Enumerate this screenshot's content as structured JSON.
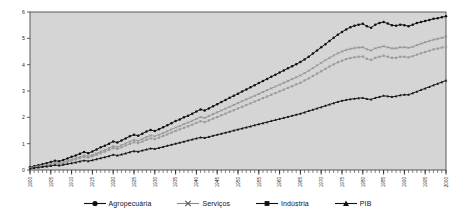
{
  "chart_data": {
    "type": "line",
    "title": "",
    "subtitle": "",
    "xlabel": "",
    "ylabel": "",
    "xlim": [
      1900,
      2000
    ],
    "ylim": [
      0,
      6
    ],
    "yticks": [
      0,
      1,
      2,
      3,
      4,
      5,
      6
    ],
    "ytick_labels": [
      "0",
      "1",
      "2",
      "3",
      "4",
      "5",
      "6"
    ],
    "xticks": [
      1900,
      1905,
      1910,
      1915,
      1920,
      1925,
      1930,
      1935,
      1940,
      1945,
      1950,
      1955,
      1960,
      1965,
      1970,
      1975,
      1980,
      1985,
      1990,
      1995,
      2000
    ],
    "xtick_labels": [
      "1900",
      "1905",
      "1910",
      "1915",
      "1920",
      "1925",
      "1930",
      "1935",
      "1940",
      "1945",
      "1950",
      "1955",
      "1960",
      "1965",
      "1970",
      "1975",
      "1980",
      "1985",
      "1990",
      "1995",
      "2000"
    ],
    "xtick_rotation": 90,
    "minor_xticks_interval": 1,
    "grid": false,
    "plot_background": "#d5d5d5",
    "legend_position": "bottom",
    "x": [
      1900,
      1901,
      1902,
      1903,
      1904,
      1905,
      1906,
      1907,
      1908,
      1909,
      1910,
      1911,
      1912,
      1913,
      1914,
      1915,
      1916,
      1917,
      1918,
      1919,
      1920,
      1921,
      1922,
      1923,
      1924,
      1925,
      1926,
      1927,
      1928,
      1929,
      1930,
      1931,
      1932,
      1933,
      1934,
      1935,
      1936,
      1937,
      1938,
      1939,
      1940,
      1941,
      1942,
      1943,
      1944,
      1945,
      1946,
      1947,
      1948,
      1949,
      1950,
      1951,
      1952,
      1953,
      1954,
      1955,
      1956,
      1957,
      1958,
      1959,
      1960,
      1961,
      1962,
      1963,
      1964,
      1965,
      1966,
      1967,
      1968,
      1969,
      1970,
      1971,
      1972,
      1973,
      1974,
      1975,
      1976,
      1977,
      1978,
      1979,
      1980,
      1981,
      1982,
      1983,
      1984,
      1985,
      1986,
      1987,
      1988,
      1989,
      1990,
      1991,
      1992,
      1993,
      1994,
      1995,
      1996,
      1997,
      1998,
      1999,
      2000
    ],
    "series": [
      {
        "name": "Agropecuária",
        "color": "#101010",
        "marker": "circle",
        "values": [
          0.1,
          0.14,
          0.18,
          0.22,
          0.26,
          0.3,
          0.35,
          0.33,
          0.38,
          0.44,
          0.5,
          0.55,
          0.62,
          0.68,
          0.64,
          0.7,
          0.78,
          0.86,
          0.92,
          1.0,
          1.08,
          1.04,
          1.12,
          1.2,
          1.28,
          1.34,
          1.3,
          1.38,
          1.46,
          1.52,
          1.48,
          1.55,
          1.62,
          1.7,
          1.78,
          1.86,
          1.92,
          2.0,
          2.06,
          2.14,
          2.22,
          2.3,
          2.26,
          2.34,
          2.42,
          2.5,
          2.58,
          2.66,
          2.74,
          2.82,
          2.9,
          2.98,
          3.06,
          3.14,
          3.22,
          3.3,
          3.38,
          3.46,
          3.54,
          3.62,
          3.7,
          3.78,
          3.86,
          3.94,
          4.02,
          4.1,
          4.2,
          4.3,
          4.42,
          4.54,
          4.66,
          4.78,
          4.9,
          5.02,
          5.14,
          5.24,
          5.34,
          5.42,
          5.48,
          5.52,
          5.55,
          5.46,
          5.4,
          5.52,
          5.58,
          5.62,
          5.56,
          5.5,
          5.48,
          5.52,
          5.5,
          5.46,
          5.52,
          5.58,
          5.62,
          5.66,
          5.7,
          5.74,
          5.76,
          5.8,
          5.84
        ]
      },
      {
        "name": "Serviços",
        "color": "#8a8a8a",
        "marker": "x",
        "values": [
          0.08,
          0.11,
          0.14,
          0.17,
          0.2,
          0.24,
          0.28,
          0.26,
          0.3,
          0.35,
          0.4,
          0.44,
          0.5,
          0.55,
          0.52,
          0.57,
          0.63,
          0.7,
          0.76,
          0.83,
          0.9,
          0.87,
          0.94,
          1.01,
          1.08,
          1.14,
          1.11,
          1.18,
          1.25,
          1.31,
          1.28,
          1.34,
          1.4,
          1.47,
          1.54,
          1.61,
          1.67,
          1.74,
          1.8,
          1.87,
          1.94,
          2.01,
          1.98,
          2.05,
          2.12,
          2.19,
          2.26,
          2.33,
          2.4,
          2.47,
          2.54,
          2.61,
          2.68,
          2.75,
          2.82,
          2.89,
          2.96,
          3.03,
          3.1,
          3.17,
          3.24,
          3.31,
          3.38,
          3.45,
          3.52,
          3.59,
          3.68,
          3.77,
          3.87,
          3.97,
          4.07,
          4.17,
          4.26,
          4.35,
          4.43,
          4.5,
          4.56,
          4.6,
          4.63,
          4.65,
          4.66,
          4.58,
          4.54,
          4.62,
          4.66,
          4.7,
          4.66,
          4.62,
          4.62,
          4.66,
          4.66,
          4.64,
          4.68,
          4.74,
          4.8,
          4.85,
          4.9,
          4.95,
          4.98,
          5.02,
          5.06
        ]
      },
      {
        "name": "Indústria",
        "color": "#9a9a9a",
        "marker": "square",
        "values": [
          0.07,
          0.09,
          0.12,
          0.15,
          0.18,
          0.21,
          0.25,
          0.23,
          0.27,
          0.31,
          0.36,
          0.4,
          0.45,
          0.5,
          0.47,
          0.52,
          0.58,
          0.64,
          0.7,
          0.76,
          0.83,
          0.8,
          0.86,
          0.93,
          0.99,
          1.05,
          1.02,
          1.08,
          1.15,
          1.2,
          1.17,
          1.23,
          1.29,
          1.35,
          1.42,
          1.48,
          1.54,
          1.6,
          1.66,
          1.72,
          1.79,
          1.85,
          1.82,
          1.88,
          1.95,
          2.01,
          2.08,
          2.14,
          2.21,
          2.27,
          2.34,
          2.4,
          2.47,
          2.53,
          2.6,
          2.66,
          2.73,
          2.79,
          2.86,
          2.92,
          2.99,
          3.05,
          3.12,
          3.18,
          3.25,
          3.31,
          3.4,
          3.48,
          3.57,
          3.66,
          3.75,
          3.84,
          3.93,
          4.01,
          4.09,
          4.15,
          4.21,
          4.25,
          4.28,
          4.3,
          4.31,
          4.22,
          4.18,
          4.26,
          4.3,
          4.34,
          4.3,
          4.26,
          4.26,
          4.3,
          4.3,
          4.28,
          4.32,
          4.38,
          4.43,
          4.48,
          4.53,
          4.58,
          4.61,
          4.65,
          4.68
        ]
      },
      {
        "name": "PIB",
        "color": "#121212",
        "marker": "triangle",
        "values": [
          0.06,
          0.08,
          0.1,
          0.12,
          0.14,
          0.16,
          0.19,
          0.17,
          0.2,
          0.23,
          0.26,
          0.29,
          0.33,
          0.36,
          0.34,
          0.37,
          0.41,
          0.45,
          0.49,
          0.53,
          0.58,
          0.55,
          0.59,
          0.63,
          0.68,
          0.72,
          0.7,
          0.74,
          0.78,
          0.82,
          0.8,
          0.84,
          0.88,
          0.92,
          0.96,
          1.0,
          1.04,
          1.08,
          1.12,
          1.16,
          1.2,
          1.24,
          1.22,
          1.26,
          1.3,
          1.34,
          1.38,
          1.42,
          1.46,
          1.5,
          1.54,
          1.58,
          1.62,
          1.66,
          1.7,
          1.74,
          1.78,
          1.82,
          1.86,
          1.9,
          1.94,
          1.98,
          2.02,
          2.06,
          2.1,
          2.14,
          2.19,
          2.24,
          2.29,
          2.34,
          2.39,
          2.44,
          2.49,
          2.54,
          2.59,
          2.63,
          2.66,
          2.69,
          2.71,
          2.73,
          2.74,
          2.7,
          2.68,
          2.74,
          2.78,
          2.82,
          2.8,
          2.78,
          2.8,
          2.84,
          2.86,
          2.86,
          2.92,
          2.98,
          3.04,
          3.1,
          3.16,
          3.22,
          3.28,
          3.34,
          3.4
        ]
      }
    ]
  },
  "legend": {
    "items": [
      {
        "label": "Agropecuária",
        "marker": "circle-marker",
        "color": "#101010"
      },
      {
        "label": "Serviços",
        "marker": "x-marker",
        "color": "#8a8a8a"
      },
      {
        "label": "Indústria",
        "marker": "square-marker",
        "color": "#101010"
      },
      {
        "label": "PIB",
        "marker": "triangle-marker",
        "color": "#101010"
      }
    ]
  }
}
